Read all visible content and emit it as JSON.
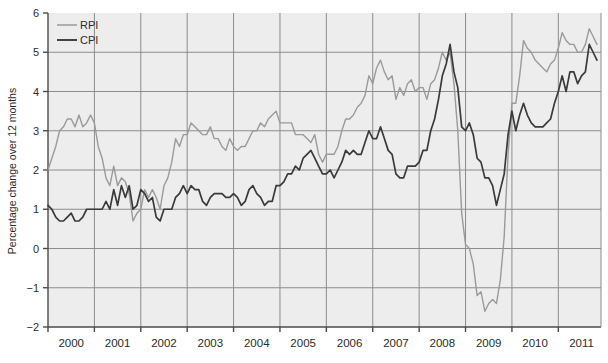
{
  "chart_data": {
    "type": "line",
    "title": "",
    "xlabel": "",
    "ylabel": "Percentage change over 12 months",
    "xlim": [
      2000.0,
      2011.92
    ],
    "ylim": [
      -2,
      6
    ],
    "yticks": [
      -2,
      -1,
      0,
      1,
      2,
      3,
      4,
      5,
      6
    ],
    "ytick_labels": [
      "−2",
      "−1",
      "0",
      "1",
      "2",
      "3",
      "4",
      "5",
      "6"
    ],
    "xticks": [
      2000,
      2001,
      2002,
      2003,
      2004,
      2005,
      2006,
      2007,
      2008,
      2009,
      2010,
      2011
    ],
    "xtick_labels": [
      "2000",
      "2001",
      "2002",
      "2003",
      "2004",
      "2005",
      "2006",
      "2007",
      "2008",
      "2009",
      "2010",
      "2011"
    ],
    "grid": true,
    "legend_position": "top-left",
    "colors": {
      "rpi": "#9a9a9a",
      "cpi": "#3a3a3a",
      "plot_background": "#ededed",
      "gridline": "#8c8c8c",
      "axis": "#4a4a4a"
    },
    "series": [
      {
        "name": "RPI",
        "color": "#9a9a9a",
        "x": [
          2000.0,
          2000.083,
          2000.167,
          2000.25,
          2000.333,
          2000.417,
          2000.5,
          2000.583,
          2000.667,
          2000.75,
          2000.833,
          2000.917,
          2001.0,
          2001.083,
          2001.167,
          2001.25,
          2001.333,
          2001.417,
          2001.5,
          2001.583,
          2001.667,
          2001.75,
          2001.833,
          2001.917,
          2002.0,
          2002.083,
          2002.167,
          2002.25,
          2002.333,
          2002.417,
          2002.5,
          2002.583,
          2002.667,
          2002.75,
          2002.833,
          2002.917,
          2003.0,
          2003.083,
          2003.167,
          2003.25,
          2003.333,
          2003.417,
          2003.5,
          2003.583,
          2003.667,
          2003.75,
          2003.833,
          2003.917,
          2004.0,
          2004.083,
          2004.167,
          2004.25,
          2004.333,
          2004.417,
          2004.5,
          2004.583,
          2004.667,
          2004.75,
          2004.833,
          2004.917,
          2005.0,
          2005.083,
          2005.167,
          2005.25,
          2005.333,
          2005.417,
          2005.5,
          2005.583,
          2005.667,
          2005.75,
          2005.833,
          2005.917,
          2006.0,
          2006.083,
          2006.167,
          2006.25,
          2006.333,
          2006.417,
          2006.5,
          2006.583,
          2006.667,
          2006.75,
          2006.833,
          2006.917,
          2007.0,
          2007.083,
          2007.167,
          2007.25,
          2007.333,
          2007.417,
          2007.5,
          2007.583,
          2007.667,
          2007.75,
          2007.833,
          2007.917,
          2008.0,
          2008.083,
          2008.167,
          2008.25,
          2008.333,
          2008.417,
          2008.5,
          2008.583,
          2008.667,
          2008.75,
          2008.833,
          2008.917,
          2009.0,
          2009.083,
          2009.167,
          2009.25,
          2009.333,
          2009.417,
          2009.5,
          2009.583,
          2009.667,
          2009.75,
          2009.833,
          2009.917,
          2010.0,
          2010.083,
          2010.167,
          2010.25,
          2010.333,
          2010.417,
          2010.5,
          2010.583,
          2010.667,
          2010.75,
          2010.833,
          2010.917,
          2011.0,
          2011.083,
          2011.167,
          2011.25,
          2011.333,
          2011.417,
          2011.5,
          2011.583,
          2011.667,
          2011.75,
          2011.833
        ],
        "values": [
          2.0,
          2.3,
          2.6,
          3.0,
          3.1,
          3.3,
          3.3,
          3.1,
          3.4,
          3.1,
          3.2,
          3.4,
          3.2,
          2.6,
          2.3,
          1.8,
          1.6,
          2.1,
          1.6,
          1.8,
          1.7,
          1.4,
          0.7,
          0.9,
          1.0,
          1.5,
          1.3,
          1.5,
          1.3,
          1.0,
          1.6,
          1.8,
          2.2,
          2.8,
          2.6,
          2.9,
          2.9,
          3.2,
          3.1,
          3.0,
          2.9,
          2.9,
          3.1,
          2.8,
          2.8,
          2.6,
          2.5,
          2.8,
          2.6,
          2.5,
          2.6,
          2.6,
          2.8,
          3.0,
          3.0,
          3.2,
          3.1,
          3.3,
          3.4,
          3.5,
          3.2,
          3.2,
          3.2,
          3.2,
          2.9,
          2.9,
          2.9,
          2.8,
          2.7,
          2.9,
          2.4,
          2.2,
          2.4,
          2.4,
          2.4,
          2.6,
          3.0,
          3.3,
          3.3,
          3.4,
          3.6,
          3.7,
          3.9,
          4.4,
          4.2,
          4.6,
          4.8,
          4.5,
          4.3,
          4.4,
          3.8,
          4.1,
          3.9,
          4.2,
          4.3,
          4.0,
          4.1,
          4.1,
          3.8,
          4.2,
          4.3,
          4.6,
          5.0,
          4.8,
          5.0,
          4.2,
          3.0,
          0.9,
          0.1,
          0.0,
          -0.4,
          -1.2,
          -1.1,
          -1.6,
          -1.4,
          -1.3,
          -1.4,
          -0.8,
          0.3,
          2.4,
          3.7,
          3.7,
          4.4,
          5.3,
          5.1,
          5.0,
          4.8,
          4.7,
          4.6,
          4.5,
          4.7,
          4.8,
          5.1,
          5.5,
          5.3,
          5.2,
          5.2,
          5.0,
          5.0,
          5.2,
          5.6,
          5.4,
          5.2
        ]
      },
      {
        "name": "CPI",
        "color": "#3a3a3a",
        "x": [
          2000.0,
          2000.083,
          2000.167,
          2000.25,
          2000.333,
          2000.417,
          2000.5,
          2000.583,
          2000.667,
          2000.75,
          2000.833,
          2000.917,
          2001.0,
          2001.083,
          2001.167,
          2001.25,
          2001.333,
          2001.417,
          2001.5,
          2001.583,
          2001.667,
          2001.75,
          2001.833,
          2001.917,
          2002.0,
          2002.083,
          2002.167,
          2002.25,
          2002.333,
          2002.417,
          2002.5,
          2002.583,
          2002.667,
          2002.75,
          2002.833,
          2002.917,
          2003.0,
          2003.083,
          2003.167,
          2003.25,
          2003.333,
          2003.417,
          2003.5,
          2003.583,
          2003.667,
          2003.75,
          2003.833,
          2003.917,
          2004.0,
          2004.083,
          2004.167,
          2004.25,
          2004.333,
          2004.417,
          2004.5,
          2004.583,
          2004.667,
          2004.75,
          2004.833,
          2004.917,
          2005.0,
          2005.083,
          2005.167,
          2005.25,
          2005.333,
          2005.417,
          2005.5,
          2005.583,
          2005.667,
          2005.75,
          2005.833,
          2005.917,
          2006.0,
          2006.083,
          2006.167,
          2006.25,
          2006.333,
          2006.417,
          2006.5,
          2006.583,
          2006.667,
          2006.75,
          2006.833,
          2006.917,
          2007.0,
          2007.083,
          2007.167,
          2007.25,
          2007.333,
          2007.417,
          2007.5,
          2007.583,
          2007.667,
          2007.75,
          2007.833,
          2007.917,
          2008.0,
          2008.083,
          2008.167,
          2008.25,
          2008.333,
          2008.417,
          2008.5,
          2008.583,
          2008.667,
          2008.75,
          2008.833,
          2008.917,
          2009.0,
          2009.083,
          2009.167,
          2009.25,
          2009.333,
          2009.417,
          2009.5,
          2009.583,
          2009.667,
          2009.75,
          2009.833,
          2009.917,
          2010.0,
          2010.083,
          2010.167,
          2010.25,
          2010.333,
          2010.417,
          2010.5,
          2010.583,
          2010.667,
          2010.75,
          2010.833,
          2010.917,
          2011.0,
          2011.083,
          2011.167,
          2011.25,
          2011.333,
          2011.417,
          2011.5,
          2011.583,
          2011.667,
          2011.75,
          2011.833
        ],
        "values": [
          1.1,
          1.0,
          0.8,
          0.7,
          0.7,
          0.8,
          0.9,
          0.7,
          0.7,
          0.8,
          1.0,
          1.0,
          1.0,
          1.0,
          1.0,
          1.2,
          1.0,
          1.5,
          1.1,
          1.6,
          1.3,
          1.6,
          1.0,
          1.1,
          1.5,
          1.4,
          1.2,
          1.3,
          0.8,
          0.7,
          1.0,
          1.0,
          1.0,
          1.3,
          1.4,
          1.6,
          1.4,
          1.6,
          1.5,
          1.5,
          1.2,
          1.1,
          1.3,
          1.4,
          1.4,
          1.4,
          1.3,
          1.3,
          1.4,
          1.3,
          1.1,
          1.2,
          1.5,
          1.6,
          1.4,
          1.3,
          1.1,
          1.2,
          1.2,
          1.6,
          1.6,
          1.7,
          1.9,
          1.9,
          2.1,
          2.0,
          2.3,
          2.4,
          2.5,
          2.3,
          2.1,
          1.9,
          1.9,
          2.0,
          1.8,
          2.0,
          2.2,
          2.5,
          2.4,
          2.5,
          2.4,
          2.4,
          2.7,
          3.0,
          2.8,
          2.8,
          3.1,
          2.8,
          2.5,
          2.4,
          1.9,
          1.8,
          1.8,
          2.1,
          2.1,
          2.1,
          2.2,
          2.5,
          2.5,
          3.0,
          3.3,
          3.8,
          4.4,
          4.7,
          5.2,
          4.5,
          4.1,
          3.1,
          3.0,
          3.2,
          2.9,
          2.3,
          2.2,
          1.8,
          1.8,
          1.6,
          1.1,
          1.5,
          1.9,
          2.9,
          3.5,
          3.0,
          3.4,
          3.7,
          3.4,
          3.2,
          3.1,
          3.1,
          3.1,
          3.2,
          3.3,
          3.7,
          4.0,
          4.4,
          4.0,
          4.5,
          4.5,
          4.2,
          4.4,
          4.5,
          5.2,
          5.0,
          4.8
        ]
      }
    ]
  },
  "legend": {
    "items": [
      {
        "label": "RPI",
        "color": "#9a9a9a"
      },
      {
        "label": "CPI",
        "color": "#3a3a3a"
      }
    ]
  }
}
